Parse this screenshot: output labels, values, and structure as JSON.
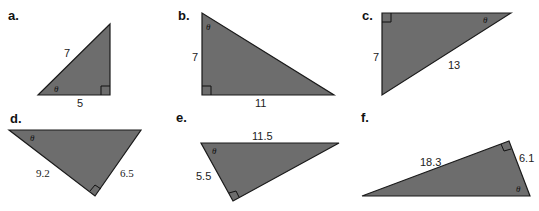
{
  "fill_color": "#6d6d6d",
  "stroke_color": "#1a1a1a",
  "angle_symbol": "θ",
  "triangles": [
    {
      "letter": "a.",
      "labels": [
        "7",
        "5"
      ],
      "angle": "θ"
    },
    {
      "letter": "b.",
      "labels": [
        "7",
        "11"
      ],
      "angle": "θ"
    },
    {
      "letter": "c.",
      "labels": [
        "7",
        "13"
      ],
      "angle": "θ"
    },
    {
      "letter": "d.",
      "labels": [
        "9.2",
        "6.5"
      ],
      "angle": "θ"
    },
    {
      "letter": "e.",
      "labels": [
        "11.5",
        "5.5"
      ],
      "angle": "θ"
    },
    {
      "letter": "f.",
      "labels": [
        "18.3",
        "6.1"
      ],
      "angle": "θ"
    }
  ]
}
